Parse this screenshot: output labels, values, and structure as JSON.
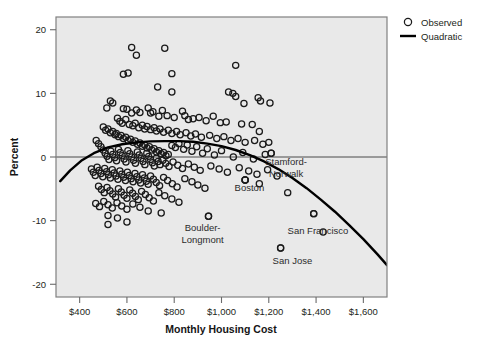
{
  "chart_data": {
    "type": "scatter",
    "title": "",
    "xlabel": "Monthly Housing Cost",
    "ylabel": "Percent",
    "xlim": [
      300,
      1700
    ],
    "ylim": [
      -22,
      22
    ],
    "grid": false,
    "plot_background": "#e9e9e9",
    "frame_color": "#808080",
    "marker_color": "#1a1a1a",
    "marker_shape": "open-circle",
    "curve_color": "#000000",
    "zero_reference_line": 0,
    "xticks": [
      400,
      600,
      800,
      1000,
      1200,
      1400,
      1600
    ],
    "xtick_labels": [
      "$400",
      "$600",
      "$800",
      "$1,000",
      "$1,200",
      "$1,400",
      "$1,600"
    ],
    "yticks": [
      20,
      10,
      0,
      -10,
      -20
    ],
    "ytick_labels": [
      "20",
      "10",
      "0",
      "-10",
      "-20"
    ],
    "legend": {
      "position": "top-right-outside",
      "entries": [
        {
          "label": "Observed",
          "marker": "open-circle"
        },
        {
          "label": "Quadratic",
          "marker": "line"
        }
      ]
    },
    "annotations": [
      {
        "text": "Stamford-Norwalk",
        "x": 1273,
        "y": -1.2,
        "point_x": 1210,
        "point_y": 0.6
      },
      {
        "text": "Boston",
        "x": 1118,
        "y": -5.4,
        "point_x": 1100,
        "point_y": -3.6
      },
      {
        "text": "Boulder-Longmont",
        "x": 920,
        "y": -11.6,
        "point_x": 945,
        "point_y": -9.3
      },
      {
        "text": "San Francisco",
        "x": 1408,
        "y": -12.1,
        "point_x": 1390,
        "point_y": -8.9
      },
      {
        "text": "San Jose",
        "x": 1300,
        "y": -16.8,
        "point_x": 1250,
        "point_y": -14.3
      }
    ],
    "quadratic_fit": {
      "label": "Quadratic",
      "vertex_x": 855,
      "vertex_y": 2.5,
      "points": [
        [
          318,
          -3.8
        ],
        [
          360,
          -2.1
        ],
        [
          410,
          -0.5
        ],
        [
          460,
          0.6
        ],
        [
          520,
          1.5
        ],
        [
          580,
          2.0
        ],
        [
          640,
          2.3
        ],
        [
          700,
          2.45
        ],
        [
          760,
          2.5
        ],
        [
          820,
          2.5
        ],
        [
          880,
          2.4
        ],
        [
          940,
          2.1
        ],
        [
          1000,
          1.7
        ],
        [
          1060,
          1.1
        ],
        [
          1120,
          0.3
        ],
        [
          1180,
          -0.7
        ],
        [
          1240,
          -1.9
        ],
        [
          1300,
          -3.3
        ],
        [
          1360,
          -4.9
        ],
        [
          1420,
          -6.7
        ],
        [
          1480,
          -8.6
        ],
        [
          1540,
          -10.7
        ],
        [
          1600,
          -12.9
        ],
        [
          1660,
          -15.3
        ],
        [
          1700,
          -17.0
        ]
      ]
    },
    "series": [
      {
        "name": "Observed",
        "n_points": 248,
        "points": [
          [
            640,
            16.0
          ],
          [
            620,
            17.2
          ],
          [
            760,
            17.1
          ],
          [
            585,
            13.0
          ],
          [
            605,
            13.2
          ],
          [
            1060,
            14.4
          ],
          [
            790,
            13.1
          ],
          [
            730,
            11.0
          ],
          [
            790,
            10.2
          ],
          [
            1048,
            10.0
          ],
          [
            1060,
            9.5
          ],
          [
            1095,
            8.4
          ],
          [
            1155,
            9.3
          ],
          [
            1165,
            8.8
          ],
          [
            1030,
            10.2
          ],
          [
            1205,
            8.5
          ],
          [
            530,
            8.8
          ],
          [
            540,
            8.5
          ],
          [
            515,
            7.7
          ],
          [
            585,
            7.6
          ],
          [
            600,
            7.5
          ],
          [
            620,
            6.9
          ],
          [
            640,
            7.4
          ],
          [
            655,
            7.0
          ],
          [
            690,
            7.7
          ],
          [
            700,
            6.9
          ],
          [
            710,
            7.1
          ],
          [
            735,
            6.4
          ],
          [
            750,
            7.3
          ],
          [
            770,
            6.5
          ],
          [
            800,
            6.2
          ],
          [
            835,
            7.2
          ],
          [
            845,
            6.5
          ],
          [
            860,
            5.9
          ],
          [
            880,
            6.0
          ],
          [
            905,
            6.2
          ],
          [
            935,
            5.7
          ],
          [
            965,
            6.4
          ],
          [
            995,
            5.4
          ],
          [
            1020,
            5.5
          ],
          [
            1085,
            5.2
          ],
          [
            1130,
            5.1
          ],
          [
            1160,
            4.0
          ],
          [
            560,
            6.1
          ],
          [
            570,
            5.6
          ],
          [
            580,
            5.3
          ],
          [
            595,
            5.9
          ],
          [
            610,
            5.1
          ],
          [
            625,
            4.9
          ],
          [
            635,
            5.3
          ],
          [
            650,
            4.6
          ],
          [
            665,
            5.0
          ],
          [
            675,
            4.4
          ],
          [
            685,
            4.8
          ],
          [
            700,
            4.3
          ],
          [
            715,
            4.6
          ],
          [
            725,
            4.1
          ],
          [
            740,
            4.4
          ],
          [
            755,
            3.9
          ],
          [
            775,
            4.2
          ],
          [
            790,
            3.7
          ],
          [
            810,
            4.0
          ],
          [
            825,
            3.5
          ],
          [
            850,
            3.8
          ],
          [
            870,
            3.3
          ],
          [
            890,
            3.6
          ],
          [
            915,
            3.1
          ],
          [
            950,
            3.4
          ],
          [
            980,
            2.9
          ],
          [
            1010,
            3.2
          ],
          [
            1040,
            2.6
          ],
          [
            1070,
            2.9
          ],
          [
            1100,
            2.3
          ],
          [
            1140,
            2.6
          ],
          [
            1175,
            2.0
          ],
          [
            1200,
            2.3
          ],
          [
            500,
            4.7
          ],
          [
            510,
            4.2
          ],
          [
            520,
            4.4
          ],
          [
            530,
            3.8
          ],
          [
            540,
            4.0
          ],
          [
            550,
            3.5
          ],
          [
            555,
            3.7
          ],
          [
            565,
            3.2
          ],
          [
            575,
            3.4
          ],
          [
            585,
            2.9
          ],
          [
            595,
            3.1
          ],
          [
            605,
            2.6
          ],
          [
            615,
            2.8
          ],
          [
            625,
            2.3
          ],
          [
            635,
            2.5
          ],
          [
            645,
            2.0
          ],
          [
            655,
            2.2
          ],
          [
            665,
            1.7
          ],
          [
            675,
            1.9
          ],
          [
            685,
            1.4
          ],
          [
            695,
            1.6
          ],
          [
            705,
            1.1
          ],
          [
            715,
            1.3
          ],
          [
            725,
            0.8
          ],
          [
            735,
            1.0
          ],
          [
            745,
            0.5
          ],
          [
            755,
            0.7
          ],
          [
            765,
            0.2
          ],
          [
            775,
            0.4
          ],
          [
            790,
            1.8
          ],
          [
            805,
            1.5
          ],
          [
            820,
            2.1
          ],
          [
            840,
            1.2
          ],
          [
            855,
            1.9
          ],
          [
            875,
            0.9
          ],
          [
            895,
            1.6
          ],
          [
            920,
            0.6
          ],
          [
            940,
            1.3
          ],
          [
            970,
            0.3
          ],
          [
            1000,
            1.0
          ],
          [
            1050,
            0.0
          ],
          [
            1090,
            0.7
          ],
          [
            1135,
            -0.3
          ],
          [
            1185,
            0.4
          ],
          [
            1210,
            0.6
          ],
          [
            470,
            2.6
          ],
          [
            480,
            2.1
          ],
          [
            490,
            1.6
          ],
          [
            500,
            1.1
          ],
          [
            508,
            0.6
          ],
          [
            516,
            0.1
          ],
          [
            524,
            -0.4
          ],
          [
            532,
            0.9
          ],
          [
            540,
            0.4
          ],
          [
            548,
            -0.1
          ],
          [
            556,
            -0.6
          ],
          [
            564,
            1.2
          ],
          [
            572,
            0.7
          ],
          [
            580,
            0.2
          ],
          [
            588,
            -0.3
          ],
          [
            596,
            -0.8
          ],
          [
            604,
            1.0
          ],
          [
            612,
            0.5
          ],
          [
            620,
            0.0
          ],
          [
            628,
            -0.5
          ],
          [
            636,
            -1.0
          ],
          [
            644,
            0.8
          ],
          [
            652,
            0.3
          ],
          [
            660,
            -0.2
          ],
          [
            668,
            -0.7
          ],
          [
            676,
            -1.2
          ],
          [
            684,
            0.6
          ],
          [
            692,
            0.1
          ],
          [
            700,
            -0.4
          ],
          [
            708,
            -0.9
          ],
          [
            716,
            -1.4
          ],
          [
            724,
            -0.2
          ],
          [
            732,
            -0.7
          ],
          [
            740,
            -1.2
          ],
          [
            752,
            -0.5
          ],
          [
            764,
            -1.0
          ],
          [
            778,
            -1.5
          ],
          [
            795,
            -0.8
          ],
          [
            815,
            -1.3
          ],
          [
            835,
            -1.8
          ],
          [
            860,
            -1.1
          ],
          [
            885,
            -1.6
          ],
          [
            910,
            -2.1
          ],
          [
            955,
            -1.4
          ],
          [
            990,
            -1.9
          ],
          [
            1025,
            -2.4
          ],
          [
            1075,
            -1.7
          ],
          [
            1115,
            -2.2
          ],
          [
            1150,
            -2.7
          ],
          [
            1195,
            -2.0
          ],
          [
            450,
            -1.9
          ],
          [
            458,
            -2.4
          ],
          [
            466,
            -2.9
          ],
          [
            474,
            -1.6
          ],
          [
            482,
            -2.1
          ],
          [
            490,
            -2.6
          ],
          [
            498,
            -3.1
          ],
          [
            506,
            -1.8
          ],
          [
            514,
            -2.3
          ],
          [
            522,
            -2.8
          ],
          [
            530,
            -3.3
          ],
          [
            538,
            -2.0
          ],
          [
            546,
            -2.5
          ],
          [
            554,
            -3.0
          ],
          [
            562,
            -3.5
          ],
          [
            570,
            -2.2
          ],
          [
            578,
            -2.7
          ],
          [
            586,
            -3.2
          ],
          [
            594,
            -3.7
          ],
          [
            602,
            -2.4
          ],
          [
            610,
            -2.9
          ],
          [
            618,
            -3.4
          ],
          [
            626,
            -3.9
          ],
          [
            634,
            -2.6
          ],
          [
            642,
            -3.1
          ],
          [
            650,
            -3.6
          ],
          [
            658,
            -4.1
          ],
          [
            666,
            -2.8
          ],
          [
            674,
            -3.3
          ],
          [
            682,
            -3.8
          ],
          [
            690,
            -4.3
          ],
          [
            700,
            -3.0
          ],
          [
            712,
            -3.5
          ],
          [
            724,
            -4.0
          ],
          [
            738,
            -4.5
          ],
          [
            755,
            -3.2
          ],
          [
            772,
            -3.7
          ],
          [
            792,
            -4.2
          ],
          [
            812,
            -4.7
          ],
          [
            845,
            -3.4
          ],
          [
            875,
            -3.9
          ],
          [
            900,
            -4.4
          ],
          [
            930,
            -4.9
          ],
          [
            1100,
            -3.6
          ],
          [
            1160,
            -4.2
          ],
          [
            1235,
            -3.0
          ],
          [
            480,
            -4.6
          ],
          [
            492,
            -5.1
          ],
          [
            504,
            -5.6
          ],
          [
            516,
            -4.8
          ],
          [
            528,
            -5.3
          ],
          [
            540,
            -5.8
          ],
          [
            552,
            -6.3
          ],
          [
            564,
            -5.0
          ],
          [
            576,
            -5.5
          ],
          [
            588,
            -6.0
          ],
          [
            600,
            -6.5
          ],
          [
            612,
            -5.2
          ],
          [
            624,
            -5.7
          ],
          [
            636,
            -6.2
          ],
          [
            648,
            -6.7
          ],
          [
            662,
            -5.4
          ],
          [
            678,
            -5.9
          ],
          [
            694,
            -6.4
          ],
          [
            712,
            -6.9
          ],
          [
            735,
            -5.6
          ],
          [
            760,
            -6.1
          ],
          [
            790,
            -6.6
          ],
          [
            820,
            -7.1
          ],
          [
            468,
            -7.3
          ],
          [
            484,
            -7.8
          ],
          [
            502,
            -7.0
          ],
          [
            520,
            -7.5
          ],
          [
            538,
            -8.0
          ],
          [
            558,
            -7.2
          ],
          [
            578,
            -7.7
          ],
          [
            600,
            -8.2
          ],
          [
            625,
            -7.4
          ],
          [
            655,
            -7.9
          ],
          [
            690,
            -8.5
          ],
          [
            745,
            -8.8
          ],
          [
            520,
            -9.2
          ],
          [
            560,
            -9.6
          ],
          [
            600,
            -10.2
          ],
          [
            520,
            -10.6
          ],
          [
            945,
            -9.3
          ],
          [
            1390,
            -8.9
          ],
          [
            1250,
            -14.3
          ],
          [
            1430,
            -11.8
          ],
          [
            1280,
            -5.6
          ],
          [
            1100,
            -3.6
          ]
        ]
      }
    ]
  },
  "figure": {
    "width": 481,
    "height": 346
  }
}
